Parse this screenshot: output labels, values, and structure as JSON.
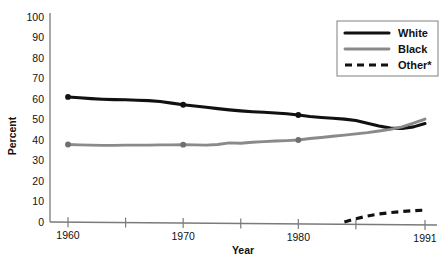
{
  "chart_data": {
    "type": "line",
    "title": "",
    "xlabel": "Year",
    "ylabel": "Percent",
    "xlim": [
      1960,
      1991
    ],
    "ylim": [
      0,
      100
    ],
    "grid": false,
    "legend_position": "top-right",
    "y_ticks": [
      0,
      10,
      20,
      30,
      40,
      50,
      60,
      70,
      80,
      90,
      100
    ],
    "x_ticks": [
      1960,
      1965,
      1970,
      1975,
      1980,
      1985,
      1991
    ],
    "x_tick_labels": [
      "1960",
      "",
      "1970",
      "",
      "1980",
      "",
      "1991"
    ],
    "legend_note": "*",
    "series": [
      {
        "name": "White",
        "color": "#111111",
        "style": "solid",
        "marked_years": [
          1960,
          1970,
          1980
        ],
        "x": [
          1960,
          1961,
          1962,
          1963,
          1964,
          1965,
          1966,
          1967,
          1968,
          1969,
          1970,
          1971,
          1972,
          1973,
          1974,
          1975,
          1976,
          1977,
          1978,
          1979,
          1980,
          1981,
          1982,
          1983,
          1984,
          1985,
          1986,
          1987,
          1988,
          1989,
          1990,
          1991
        ],
        "values": [
          61.0,
          60.6,
          60.2,
          59.9,
          59.7,
          59.6,
          59.4,
          59.2,
          58.8,
          58.0,
          57.2,
          56.6,
          56.0,
          55.3,
          54.7,
          54.2,
          53.8,
          53.5,
          53.2,
          52.8,
          52.2,
          51.5,
          51.0,
          50.6,
          50.2,
          49.5,
          48.2,
          46.8,
          45.8,
          45.6,
          46.4,
          48.0
        ]
      },
      {
        "name": "Black",
        "color": "#8a8a8a",
        "style": "solid",
        "marked_years": [
          1960,
          1970,
          1980
        ],
        "x": [
          1960,
          1961,
          1962,
          1963,
          1964,
          1965,
          1966,
          1967,
          1968,
          1969,
          1970,
          1971,
          1972,
          1973,
          1974,
          1975,
          1976,
          1977,
          1978,
          1979,
          1980,
          1981,
          1982,
          1983,
          1984,
          1985,
          1986,
          1987,
          1988,
          1989,
          1990,
          1991
        ],
        "values": [
          37.8,
          37.6,
          37.5,
          37.4,
          37.4,
          37.5,
          37.5,
          37.5,
          37.6,
          37.6,
          37.7,
          37.6,
          37.5,
          37.8,
          38.6,
          38.4,
          38.9,
          39.2,
          39.5,
          39.7,
          40.0,
          40.7,
          41.2,
          41.8,
          42.4,
          43.0,
          43.6,
          44.4,
          45.2,
          46.4,
          48.2,
          50.2
        ]
      },
      {
        "name": "Other*",
        "color": "#111111",
        "style": "dashed",
        "marked_years": [],
        "x": [
          1984,
          1985,
          1986,
          1987,
          1988,
          1989,
          1990,
          1991
        ],
        "values": [
          0.0,
          1.6,
          2.9,
          3.9,
          4.6,
          5.1,
          5.5,
          5.8
        ]
      }
    ]
  },
  "legend": {
    "items": [
      {
        "label": "White"
      },
      {
        "label": "Black"
      },
      {
        "label": "Other*"
      }
    ]
  },
  "axes": {
    "y_title": "Percent",
    "x_title": "Year"
  }
}
